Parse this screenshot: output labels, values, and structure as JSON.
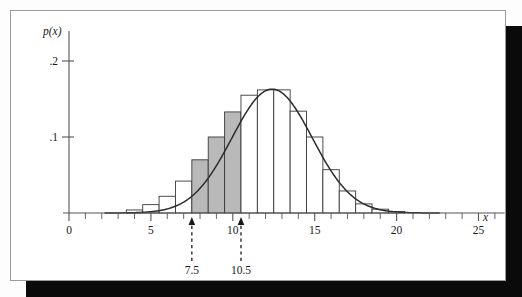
{
  "figure": {
    "frame_border_color": "#9a9a9a",
    "plate_background": "#ffffff",
    "shadow_color": "#0a0a0a",
    "page_background": "#fdfdfd"
  },
  "chart_data": {
    "type": "bar",
    "title": "",
    "subtitle": "",
    "xlabel": "x",
    "ylabel": "p(x)",
    "xlim": [
      0,
      26.5
    ],
    "ylim": [
      0,
      0.225
    ],
    "grid": false,
    "legend": null,
    "x_tick_labels": [
      "0",
      "5",
      "10",
      "15",
      "20",
      "25"
    ],
    "x_tick_values": [
      0,
      5,
      10,
      15,
      20,
      25
    ],
    "x_minor_tick_step": 1,
    "y_tick_labels": [
      ".1",
      ".2"
    ],
    "y_tick_values": [
      0.1,
      0.2
    ],
    "bar_width": 1,
    "categories": [
      4,
      5,
      6,
      7,
      8,
      9,
      10,
      11,
      12,
      13,
      14,
      15,
      16,
      17,
      18,
      19,
      20
    ],
    "values": [
      0.004,
      0.011,
      0.022,
      0.042,
      0.07,
      0.1,
      0.133,
      0.155,
      0.162,
      0.162,
      0.134,
      0.1,
      0.057,
      0.029,
      0.012,
      0.005,
      0.002
    ],
    "bar_edge_color": "#3a3a3a",
    "bar_fill_color": "#ffffff",
    "shaded_fill_color": "#b9b9b9",
    "shaded_categories": [
      8,
      9,
      10
    ],
    "shaded_region": {
      "from": 7.5,
      "to": 10.5
    },
    "curve": {
      "name": "normal approximation",
      "type": "line",
      "color": "#2c2c2c",
      "mean": 12.4,
      "sigma": 2.45,
      "peak": 0.163
    },
    "annotations": [
      {
        "label": "7.5",
        "x": 7.5,
        "kind": "arrow-up-dashed"
      },
      {
        "label": "10.5",
        "x": 10.5,
        "kind": "arrow-up-dashed"
      }
    ]
  }
}
